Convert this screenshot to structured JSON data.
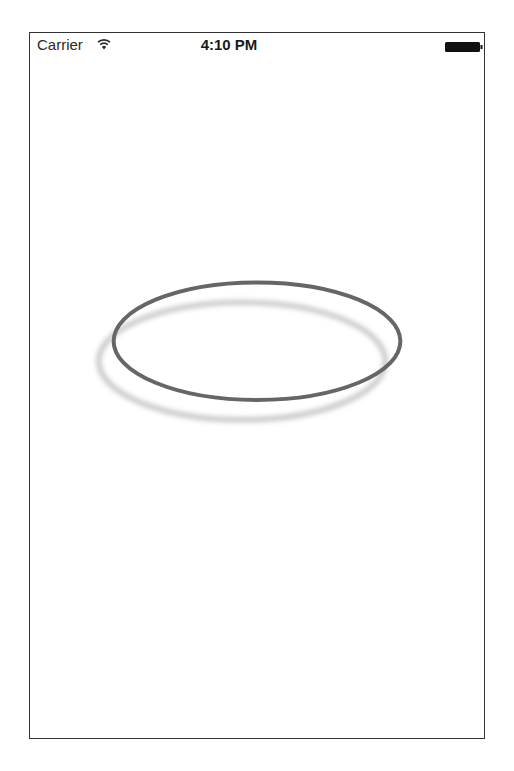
{
  "status_bar": {
    "carrier": "Carrier",
    "time": "4:10 PM",
    "wifi_icon": "wifi-icon",
    "battery_icon": "battery-full-icon"
  },
  "content": {
    "shape": "ellipse",
    "stroke_color": "#666666",
    "shadow_color": "#c8c8c8"
  }
}
